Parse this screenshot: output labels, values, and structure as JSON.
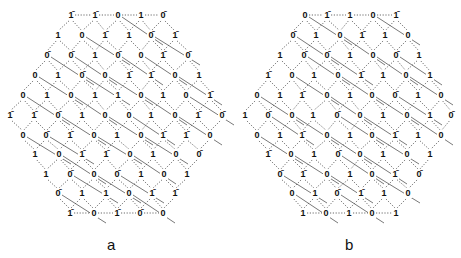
{
  "figure": {
    "panels": [
      {
        "id": "a",
        "label": "a",
        "label_pos": [
          112,
          246
        ],
        "rows": [
          {
            "y": 15,
            "nodes": [
              [
                71,
                "1̄"
              ],
              [
                95,
                "1̄"
              ],
              [
                118,
                "0"
              ],
              [
                141,
                "1"
              ],
              [
                163,
                "0̄"
              ]
            ]
          },
          {
            "y": 35,
            "nodes": [
              [
                58,
                "1"
              ],
              [
                82,
                "0"
              ],
              [
                105,
                "1̄"
              ],
              [
                129,
                "1"
              ],
              [
                151,
                "0̄"
              ],
              [
                175,
                "1̄"
              ]
            ]
          },
          {
            "y": 55,
            "nodes": [
              [
                47,
                "0̄"
              ],
              [
                71,
                "0̄"
              ],
              [
                95,
                "1"
              ],
              [
                118,
                "0̄"
              ],
              [
                141,
                "0"
              ],
              [
                163,
                "1̄"
              ],
              [
                188,
                "0̄"
              ]
            ]
          },
          {
            "y": 75,
            "nodes": [
              [
                35,
                "0"
              ],
              [
                58,
                "1"
              ],
              [
                82,
                "0̄"
              ],
              [
                105,
                "0"
              ],
              [
                129,
                "1̄"
              ],
              [
                151,
                "1̄"
              ],
              [
                175,
                "0"
              ],
              [
                199,
                "1"
              ]
            ]
          },
          {
            "y": 95,
            "nodes": [
              [
                23,
                "0"
              ],
              [
                47,
                "1"
              ],
              [
                71,
                "0"
              ],
              [
                95,
                "1"
              ],
              [
                118,
                "1"
              ],
              [
                141,
                "0"
              ],
              [
                163,
                "1"
              ],
              [
                186,
                "0"
              ],
              [
                210,
                "1̄"
              ]
            ]
          },
          {
            "y": 115,
            "nodes": [
              [
                10,
                "1̄"
              ],
              [
                34,
                "1̄"
              ],
              [
                58,
                "0̄"
              ],
              [
                82,
                "1"
              ],
              [
                105,
                "0"
              ],
              [
                129,
                "0"
              ],
              [
                151,
                "1"
              ],
              [
                175,
                "0"
              ],
              [
                198,
                "1̄"
              ],
              [
                222,
                "0̄"
              ]
            ]
          },
          {
            "y": 135,
            "nodes": [
              [
                23,
                "0"
              ],
              [
                46,
                "0̄"
              ],
              [
                70,
                "1̄"
              ],
              [
                94,
                "0"
              ],
              [
                117,
                "1"
              ],
              [
                141,
                "0"
              ],
              [
                163,
                "1̄"
              ],
              [
                186,
                "1̄"
              ],
              [
                210,
                "0"
              ]
            ]
          },
          {
            "y": 154,
            "nodes": [
              [
                35,
                "1"
              ],
              [
                59,
                "0"
              ],
              [
                82,
                "1̄"
              ],
              [
                106,
                "1̄"
              ],
              [
                130,
                "0"
              ],
              [
                153,
                "1"
              ],
              [
                176,
                "0"
              ],
              [
                199,
                "0̄"
              ]
            ]
          },
          {
            "y": 174,
            "nodes": [
              [
                46,
                "1"
              ],
              [
                70,
                "0̄"
              ],
              [
                94,
                "0"
              ],
              [
                117,
                "0̄"
              ],
              [
                141,
                "1"
              ],
              [
                164,
                "0"
              ],
              [
                187,
                "1"
              ]
            ]
          },
          {
            "y": 193,
            "nodes": [
              [
                58,
                "0̄"
              ],
              [
                82,
                "1"
              ],
              [
                106,
                "1"
              ],
              [
                129,
                "0"
              ],
              [
                152,
                "1̄"
              ],
              [
                175,
                "1̄"
              ]
            ]
          },
          {
            "y": 213,
            "nodes": [
              [
                70,
                "1̄"
              ],
              [
                94,
                "0"
              ],
              [
                117,
                "1̄"
              ],
              [
                140,
                "0̄"
              ],
              [
                163,
                "0"
              ]
            ]
          }
        ]
      },
      {
        "id": "b",
        "label": "b",
        "label_pos": [
          350,
          246
        ],
        "rows": [
          {
            "y": 15,
            "nodes": [
              [
                305,
                "0"
              ],
              [
                327,
                "1̄"
              ],
              [
                350,
                "1"
              ],
              [
                373,
                "0"
              ],
              [
                396,
                "1̄"
              ]
            ]
          },
          {
            "y": 35,
            "nodes": [
              [
                293,
                "0̄"
              ],
              [
                316,
                "1"
              ],
              [
                340,
                "0"
              ],
              [
                362,
                "1̄"
              ],
              [
                385,
                "1"
              ],
              [
                408,
                "0"
              ]
            ]
          },
          {
            "y": 55,
            "nodes": [
              [
                280,
                "1"
              ],
              [
                304,
                "0̄"
              ],
              [
                327,
                "0̄"
              ],
              [
                350,
                "1"
              ],
              [
                373,
                "0"
              ],
              [
                396,
                "0̄"
              ],
              [
                419,
                "1"
              ]
            ]
          },
          {
            "y": 75,
            "nodes": [
              [
                268,
                "1̄"
              ],
              [
                292,
                "0"
              ],
              [
                314,
                "1"
              ],
              [
                338,
                "0"
              ],
              [
                361,
                "1̄"
              ],
              [
                383,
                "1"
              ],
              [
                406,
                "0"
              ],
              [
                430,
                "1"
              ]
            ]
          },
          {
            "y": 95,
            "nodes": [
              [
                257,
                "0"
              ],
              [
                280,
                "1"
              ],
              [
                302,
                "1̄"
              ],
              [
                327,
                "0"
              ],
              [
                350,
                "1"
              ],
              [
                372,
                "0"
              ],
              [
                395,
                "0̄"
              ],
              [
                418,
                "1"
              ],
              [
                441,
                "0"
              ]
            ]
          },
          {
            "y": 115,
            "nodes": [
              [
                245,
                "1"
              ],
              [
                268,
                "0̄"
              ],
              [
                292,
                "0"
              ],
              [
                313,
                "1"
              ],
              [
                337,
                "0̄"
              ],
              [
                360,
                "0"
              ],
              [
                383,
                "1"
              ],
              [
                407,
                "0"
              ],
              [
                430,
                "1"
              ],
              [
                451,
                "0̄"
              ]
            ]
          },
          {
            "y": 135,
            "nodes": [
              [
                257,
                "0"
              ],
              [
                280,
                "1"
              ],
              [
                302,
                "1̄"
              ],
              [
                327,
                "0"
              ],
              [
                350,
                "1"
              ],
              [
                372,
                "0"
              ],
              [
                395,
                "1̄"
              ],
              [
                418,
                "1"
              ],
              [
                441,
                "0"
              ]
            ]
          },
          {
            "y": 154,
            "nodes": [
              [
                268,
                "1̄"
              ],
              [
                291,
                "0"
              ],
              [
                314,
                "1"
              ],
              [
                338,
                "0̄"
              ],
              [
                360,
                "0"
              ],
              [
                383,
                "1"
              ],
              [
                407,
                "0"
              ],
              [
                430,
                "1"
              ]
            ]
          },
          {
            "y": 174,
            "nodes": [
              [
                280,
                "0̄"
              ],
              [
                303,
                "1̄"
              ],
              [
                327,
                "0"
              ],
              [
                350,
                "1"
              ],
              [
                372,
                "0"
              ],
              [
                395,
                "1̄"
              ],
              [
                419,
                "0̄"
              ]
            ]
          },
          {
            "y": 193,
            "nodes": [
              [
                292,
                "0"
              ],
              [
                315,
                "1"
              ],
              [
                337,
                "0̄"
              ],
              [
                361,
                "1̄"
              ],
              [
                384,
                "1"
              ],
              [
                408,
                "0"
              ]
            ]
          },
          {
            "y": 213,
            "nodes": [
              [
                303,
                "1"
              ],
              [
                326,
                "0"
              ],
              [
                349,
                "1"
              ],
              [
                372,
                "0"
              ],
              [
                396,
                "1"
              ]
            ]
          }
        ]
      }
    ],
    "colors": {
      "ink": "#111111",
      "edge": "#444444",
      "background": "#ffffff"
    }
  }
}
